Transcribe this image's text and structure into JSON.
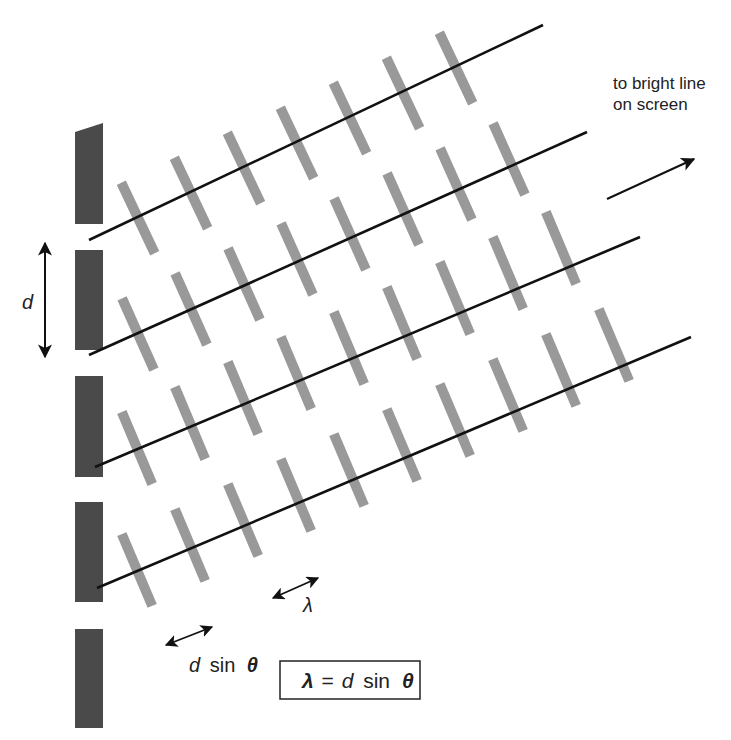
{
  "colors": {
    "slit": "#4a4a4a",
    "ray": "#111111",
    "wavefront": "#999999",
    "text": "#222222",
    "background": "#ffffff"
  },
  "labels": {
    "direction_line1": "to bright line",
    "direction_line2": "on screen",
    "slit_spacing": "d",
    "path_difference_d": "d",
    "path_difference_sin": "sin",
    "path_difference_theta": "θ",
    "wavelength": "λ",
    "equation_lambda": "λ",
    "equation_equals": "=",
    "equation_d": "d",
    "equation_sin": "sin",
    "equation_theta": "θ"
  },
  "slits": [
    {
      "x": 75,
      "y": 123,
      "w": 28,
      "h": 101,
      "slanted_top": true
    },
    {
      "x": 75,
      "y": 250,
      "w": 28,
      "h": 100
    },
    {
      "x": 75,
      "y": 376,
      "w": 28,
      "h": 101
    },
    {
      "x": 75,
      "y": 502,
      "w": 28,
      "h": 100
    },
    {
      "x": 75,
      "y": 629,
      "w": 28,
      "h": 99
    }
  ],
  "rays": [
    {
      "x1": 89,
      "y1": 240,
      "x2": 543,
      "y2": 25,
      "first_wavefront": [
        138,
        218
      ],
      "wavefront_count": 7
    },
    {
      "x1": 89,
      "y1": 355,
      "x2": 587,
      "y2": 132,
      "first_wavefront": [
        138,
        334
      ],
      "wavefront_count": 8
    },
    {
      "x1": 95,
      "y1": 467,
      "x2": 640,
      "y2": 237,
      "first_wavefront": [
        137,
        448
      ],
      "wavefront_count": 9
    },
    {
      "x1": 97,
      "y1": 588,
      "x2": 691,
      "y2": 337,
      "first_wavefront": [
        137,
        570
      ],
      "wavefront_count": 10
    }
  ],
  "wavefront_step": {
    "dx": 53,
    "dy": -25
  },
  "wavefront_half_length": 39
}
